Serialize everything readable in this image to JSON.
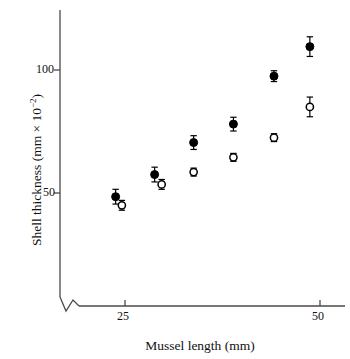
{
  "chart_data": {
    "type": "scatter",
    "title": "",
    "xlabel": "Mussel length (mm)",
    "ylabel": "Shell thickness (mm × 10⁻²)",
    "ylabel_base": "Shell thickness (mm × 10",
    "ylabel_exponent": "−2",
    "ylabel_close": ")",
    "xlim": [
      21.0,
      51.5
    ],
    "ylim": [
      38.0,
      122.0
    ],
    "x_ticks": [
      25,
      50
    ],
    "x_tick_labels": [
      "25",
      "50"
    ],
    "y_ticks": [
      50,
      100
    ],
    "y_tick_labels": [
      "50",
      "100"
    ],
    "grid": false,
    "legend": "none",
    "axis_break": "x-axis origin break (zigzag)",
    "series": [
      {
        "name": "filled-circles",
        "marker": "filled-circle",
        "color": "#000000",
        "points": [
          {
            "x": 23.8,
            "y": 48.5,
            "yerr": 3.0
          },
          {
            "x": 28.8,
            "y": 57.5,
            "yerr": 3.0
          },
          {
            "x": 33.8,
            "y": 70.5,
            "yerr": 2.8
          },
          {
            "x": 38.9,
            "y": 78.0,
            "yerr": 2.8
          },
          {
            "x": 44.1,
            "y": 97.5,
            "yerr": 2.2
          },
          {
            "x": 48.7,
            "y": 109.5,
            "yerr": 4.0
          }
        ]
      },
      {
        "name": "open-circles",
        "marker": "open-circle",
        "color": "#000000",
        "points": [
          {
            "x": 24.6,
            "y": 45.0,
            "yerr": 2.0
          },
          {
            "x": 29.7,
            "y": 53.5,
            "yerr": 2.0
          },
          {
            "x": 33.8,
            "y": 58.5,
            "yerr": 1.6
          },
          {
            "x": 38.9,
            "y": 64.5,
            "yerr": 1.6
          },
          {
            "x": 44.1,
            "y": 72.5,
            "yerr": 1.6
          },
          {
            "x": 48.7,
            "y": 85.0,
            "yerr": 4.0
          }
        ]
      }
    ]
  }
}
